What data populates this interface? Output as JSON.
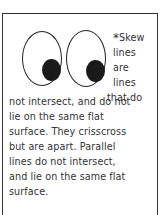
{
  "card": {
    "asterisk": "*",
    "narrow_lines": [
      "Skew",
      "lines",
      "are",
      "lines",
      "that do"
    ],
    "wide_lines": [
      "not intersect, and do not",
      "lie on the same flat",
      "surface.  They crisscross",
      "but are apart. Parallel",
      "lines do not intersect,",
      "and lie on the same flat",
      "surface."
    ],
    "illustration": "two-cartoon-eyes"
  }
}
